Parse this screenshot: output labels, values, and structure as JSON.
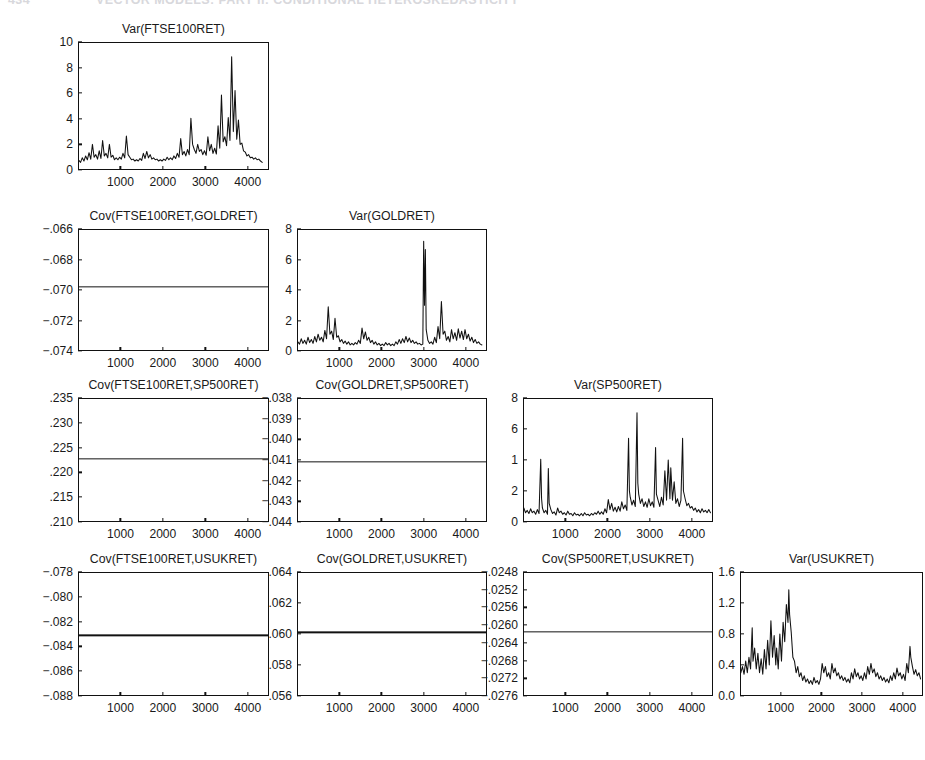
{
  "header": {
    "folio": "434",
    "running_head": "VECTOR MODELS: PART II: CONDITIONAL HETEROSKEDASTICITY"
  },
  "figure": {
    "layout": "lower-triangular matrix of variance/covariance plots",
    "rows": 4,
    "columns": 4,
    "shared_x_ticks": [
      "1000",
      "2000",
      "3000",
      "4000"
    ]
  },
  "chart_data": [
    {
      "id": "var-ftse100ret",
      "type": "line",
      "title": "Var(FTSE100RET)",
      "xlabel": "",
      "ylabel": "",
      "grid": false,
      "legend": false,
      "xlim": [
        0,
        4500
      ],
      "ylim": [
        0,
        10
      ],
      "xticks": [
        1000,
        2000,
        3000,
        4000
      ],
      "yticks": [
        0,
        2,
        4,
        6,
        8,
        10
      ],
      "ytick_labels": [
        "0",
        "2",
        "4",
        "6",
        "8",
        "10"
      ],
      "x": [
        20,
        60,
        100,
        140,
        180,
        220,
        260,
        300,
        340,
        380,
        420,
        460,
        500,
        540,
        580,
        620,
        660,
        700,
        740,
        780,
        820,
        860,
        900,
        940,
        980,
        1020,
        1060,
        1100,
        1140,
        1180,
        1220,
        1260,
        1300,
        1340,
        1380,
        1420,
        1460,
        1500,
        1540,
        1580,
        1620,
        1660,
        1700,
        1740,
        1780,
        1820,
        1860,
        1900,
        1940,
        1980,
        2020,
        2060,
        2100,
        2140,
        2180,
        2220,
        2260,
        2300,
        2340,
        2380,
        2420,
        2460,
        2500,
        2540,
        2580,
        2620,
        2660,
        2700,
        2740,
        2780,
        2820,
        2860,
        2900,
        2940,
        2980,
        3020,
        3060,
        3100,
        3140,
        3180,
        3220,
        3260,
        3300,
        3340,
        3380,
        3420,
        3460,
        3500,
        3540,
        3580,
        3620,
        3660,
        3700,
        3740,
        3780,
        3820,
        3860,
        3900,
        3940,
        3980,
        4020,
        4060,
        4100,
        4140,
        4180,
        4220,
        4260,
        4300,
        4340,
        4380,
        4420
      ],
      "values": [
        0.75,
        0.6,
        0.95,
        0.7,
        1.1,
        0.8,
        1.35,
        0.85,
        2.0,
        1.0,
        1.2,
        0.85,
        1.5,
        0.9,
        2.3,
        1.1,
        1.3,
        0.95,
        2.0,
        1.0,
        1.15,
        0.8,
        0.95,
        0.8,
        1.0,
        0.85,
        1.3,
        0.95,
        2.65,
        1.2,
        1.0,
        0.8,
        0.85,
        0.7,
        0.8,
        0.7,
        0.9,
        0.75,
        1.3,
        0.9,
        1.45,
        0.95,
        1.2,
        0.85,
        0.95,
        0.8,
        0.85,
        0.7,
        0.8,
        0.7,
        0.85,
        0.75,
        1.0,
        0.8,
        0.95,
        0.8,
        1.1,
        0.9,
        1.3,
        1.0,
        2.45,
        1.2,
        1.45,
        1.1,
        1.6,
        1.2,
        4.05,
        2.0,
        1.6,
        1.3,
        2.0,
        1.45,
        1.6,
        1.2,
        1.5,
        1.15,
        2.6,
        1.5,
        2.0,
        1.3,
        1.7,
        1.25,
        3.45,
        1.7,
        5.85,
        2.2,
        2.6,
        1.9,
        4.1,
        2.3,
        8.85,
        3.0,
        6.2,
        2.4,
        3.9,
        2.0,
        2.1,
        1.5,
        1.4,
        1.1,
        1.2,
        0.95,
        1.0,
        0.85,
        0.95,
        0.8,
        0.85,
        0.7,
        0.6
      ]
    },
    {
      "id": "cov-ftse100ret-goldret",
      "type": "line",
      "title": "Cov(FTSE100RET,GOLDRET)",
      "constant": true,
      "constant_value": -0.0698,
      "xlabel": "",
      "ylabel": "",
      "grid": false,
      "legend": false,
      "xlim": [
        0,
        4500
      ],
      "ylim": [
        -0.074,
        -0.066
      ],
      "xticks": [
        1000,
        2000,
        3000,
        4000
      ],
      "yticks": [
        -0.066,
        -0.068,
        -0.07,
        -0.072,
        -0.074
      ],
      "ytick_labels": [
        "−.066",
        "−.068",
        "−.070",
        "−.072",
        "−.074"
      ]
    },
    {
      "id": "var-goldret",
      "type": "line",
      "title": "Var(GOLDRET)",
      "xlabel": "",
      "ylabel": "",
      "grid": false,
      "legend": false,
      "xlim": [
        0,
        4500
      ],
      "ylim": [
        0,
        8
      ],
      "xticks": [
        1000,
        2000,
        3000,
        4000
      ],
      "yticks": [
        0,
        2,
        4,
        6,
        8
      ],
      "ytick_labels": [
        "0",
        "2",
        "4",
        "6",
        "8"
      ],
      "x": [
        20,
        60,
        100,
        140,
        180,
        220,
        260,
        300,
        340,
        380,
        420,
        460,
        500,
        540,
        580,
        620,
        660,
        700,
        740,
        780,
        820,
        860,
        900,
        940,
        980,
        1020,
        1060,
        1100,
        1140,
        1180,
        1220,
        1260,
        1300,
        1340,
        1380,
        1420,
        1460,
        1500,
        1540,
        1580,
        1620,
        1660,
        1700,
        1740,
        1780,
        1820,
        1860,
        1900,
        1940,
        1980,
        2020,
        2060,
        2100,
        2140,
        2180,
        2220,
        2260,
        2300,
        2340,
        2380,
        2420,
        2460,
        2500,
        2540,
        2580,
        2620,
        2660,
        2700,
        2740,
        2780,
        2820,
        2860,
        2900,
        2940,
        2980,
        3000,
        3020,
        3040,
        3060,
        3100,
        3140,
        3180,
        3220,
        3260,
        3300,
        3340,
        3380,
        3420,
        3460,
        3500,
        3540,
        3580,
        3620,
        3660,
        3700,
        3740,
        3780,
        3820,
        3860,
        3900,
        3940,
        3980,
        4020,
        4060,
        4100,
        4140,
        4180,
        4220,
        4260,
        4300,
        4340,
        4380,
        4420
      ],
      "values": [
        0.6,
        0.45,
        0.8,
        0.5,
        0.7,
        0.45,
        0.9,
        0.55,
        0.75,
        0.5,
        0.95,
        0.6,
        1.1,
        0.7,
        0.9,
        0.6,
        1.35,
        0.8,
        2.9,
        1.1,
        1.3,
        0.75,
        2.15,
        0.9,
        1.0,
        0.6,
        0.75,
        0.5,
        0.65,
        0.45,
        0.6,
        0.4,
        0.5,
        0.4,
        0.55,
        0.45,
        0.7,
        0.5,
        1.5,
        0.8,
        1.25,
        0.7,
        0.9,
        0.55,
        0.7,
        0.45,
        0.6,
        0.4,
        0.5,
        0.35,
        0.45,
        0.35,
        0.55,
        0.4,
        0.5,
        0.35,
        0.45,
        0.35,
        0.6,
        0.45,
        0.75,
        0.5,
        0.8,
        0.55,
        0.95,
        0.6,
        0.85,
        0.55,
        0.7,
        0.5,
        0.6,
        0.45,
        0.5,
        0.4,
        0.45,
        7.2,
        3.0,
        6.65,
        1.4,
        0.7,
        0.5,
        0.6,
        0.45,
        0.9,
        0.55,
        1.6,
        0.8,
        3.25,
        1.1,
        1.3,
        0.7,
        0.95,
        0.6,
        1.4,
        0.8,
        1.2,
        0.7,
        1.45,
        0.85,
        1.3,
        0.75,
        1.4,
        0.8,
        1.1,
        0.65,
        0.9,
        0.55,
        0.75,
        0.5,
        0.6,
        0.45,
        0.4
      ]
    },
    {
      "id": "cov-ftse100ret-sp500ret",
      "type": "line",
      "title": "Cov(FTSE100RET,SP500RET)",
      "constant": true,
      "constant_value": 0.2228,
      "xlabel": "",
      "ylabel": "",
      "grid": false,
      "legend": false,
      "xlim": [
        0,
        4500
      ],
      "ylim": [
        0.21,
        0.235
      ],
      "xticks": [
        1000,
        2000,
        3000,
        4000
      ],
      "yticks": [
        0.235,
        0.23,
        0.225,
        0.22,
        0.215,
        0.21
      ],
      "ytick_labels": [
        ".235",
        ".230",
        ".225",
        ".220",
        ".215",
        ".210"
      ]
    },
    {
      "id": "cov-goldret-sp500ret",
      "type": "line",
      "title": "Cov(GOLDRET,SP500RET)",
      "constant": true,
      "constant_value": -0.0411,
      "xlabel": "",
      "ylabel": "",
      "grid": false,
      "legend": false,
      "xlim": [
        0,
        4500
      ],
      "ylim": [
        -0.044,
        -0.038
      ],
      "xticks": [
        1000,
        2000,
        3000,
        4000
      ],
      "yticks": [
        -0.038,
        -0.039,
        -0.04,
        -0.041,
        -0.042,
        -0.043,
        -0.044
      ],
      "ytick_labels": [
        "−.038",
        "−.039",
        "−.040",
        "−.041",
        "−.042",
        "−.043",
        "−.044"
      ]
    },
    {
      "id": "var-sp500ret",
      "type": "line",
      "title": "Var(SP500RET)",
      "xlabel": "",
      "ylabel": "",
      "grid": false,
      "legend": false,
      "xlim": [
        0,
        4500
      ],
      "ylim": [
        0,
        8
      ],
      "xticks": [
        1000,
        2000,
        3000,
        4000
      ],
      "yticks": [
        0,
        2,
        4,
        6,
        8
      ],
      "ytick_labels": [
        "0",
        "2",
        "1",
        "6",
        "8"
      ],
      "ytick_labels_note": "third label from top renders as '1' in the scan (degraded '4')",
      "x": [
        20,
        60,
        100,
        140,
        180,
        220,
        260,
        300,
        340,
        380,
        420,
        440,
        460,
        500,
        540,
        580,
        600,
        620,
        660,
        700,
        740,
        780,
        820,
        860,
        900,
        940,
        980,
        1020,
        1060,
        1100,
        1140,
        1180,
        1220,
        1260,
        1300,
        1340,
        1380,
        1420,
        1460,
        1500,
        1540,
        1580,
        1620,
        1660,
        1700,
        1740,
        1780,
        1820,
        1860,
        1900,
        1940,
        1980,
        2020,
        2060,
        2100,
        2140,
        2180,
        2220,
        2260,
        2300,
        2340,
        2380,
        2420,
        2460,
        2500,
        2520,
        2540,
        2580,
        2620,
        2660,
        2700,
        2720,
        2740,
        2780,
        2820,
        2860,
        2900,
        2940,
        2980,
        3020,
        3060,
        3100,
        3140,
        3160,
        3200,
        3240,
        3280,
        3320,
        3360,
        3400,
        3440,
        3480,
        3500,
        3540,
        3580,
        3620,
        3660,
        3700,
        3740,
        3780,
        3800,
        3840,
        3880,
        3920,
        3960,
        4000,
        4040,
        4080,
        4120,
        4160,
        4200,
        4240,
        4280,
        4320,
        4360,
        4400,
        4440
      ],
      "values": [
        0.9,
        0.6,
        0.75,
        0.55,
        0.85,
        0.6,
        0.7,
        0.5,
        0.8,
        0.55,
        4.05,
        1.5,
        0.9,
        0.6,
        0.75,
        0.5,
        3.45,
        1.2,
        0.8,
        0.55,
        0.65,
        0.45,
        0.9,
        0.6,
        0.7,
        0.5,
        0.6,
        0.45,
        0.7,
        0.5,
        0.55,
        0.4,
        0.6,
        0.45,
        0.5,
        0.4,
        0.55,
        0.4,
        0.6,
        0.45,
        0.5,
        0.4,
        0.55,
        0.45,
        0.6,
        0.5,
        0.7,
        0.5,
        0.65,
        0.5,
        0.85,
        0.6,
        1.45,
        0.8,
        1.2,
        0.7,
        0.95,
        0.65,
        1.0,
        0.7,
        1.3,
        0.85,
        1.1,
        0.75,
        5.4,
        2.0,
        1.6,
        1.1,
        1.4,
        1.0,
        7.05,
        2.5,
        1.8,
        1.2,
        1.5,
        1.0,
        1.3,
        0.95,
        1.5,
        1.05,
        1.3,
        0.95,
        4.8,
        1.8,
        1.4,
        1.0,
        1.6,
        1.1,
        3.3,
        1.4,
        4.0,
        1.5,
        3.5,
        1.4,
        2.6,
        1.2,
        1.5,
        1.0,
        1.4,
        5.4,
        2.0,
        1.5,
        1.05,
        1.2,
        0.9,
        1.0,
        0.75,
        0.9,
        0.65,
        0.8,
        0.6,
        0.85,
        0.65,
        0.75,
        0.6,
        0.8,
        0.6,
        0.7
      ]
    },
    {
      "id": "cov-ftse100ret-usukret",
      "type": "line",
      "title": "Cov(FTSE100RET,USUKRET)",
      "constant": true,
      "constant_value": -0.0831,
      "xlabel": "",
      "ylabel": "",
      "grid": false,
      "legend": false,
      "xlim": [
        0,
        4500
      ],
      "ylim": [
        -0.088,
        -0.078
      ],
      "xticks": [
        1000,
        2000,
        3000,
        4000
      ],
      "yticks": [
        -0.078,
        -0.08,
        -0.082,
        -0.084,
        -0.086,
        -0.088
      ],
      "ytick_labels": [
        "−.078",
        "−.080",
        "−.082",
        "−.084",
        "−.086",
        "−.088"
      ]
    },
    {
      "id": "cov-goldret-usukret",
      "type": "line",
      "title": "Cov(GOLDRET,USUKRET)",
      "constant": true,
      "constant_value": 0.0601,
      "xlabel": "",
      "ylabel": "",
      "grid": false,
      "legend": false,
      "xlim": [
        0,
        4500
      ],
      "ylim": [
        0.056,
        0.064
      ],
      "xticks": [
        1000,
        2000,
        3000,
        4000
      ],
      "yticks": [
        0.064,
        0.062,
        0.06,
        0.058,
        0.056
      ],
      "ytick_labels": [
        ".064",
        ".062",
        ".060",
        ".058",
        ".056"
      ]
    },
    {
      "id": "cov-sp500ret-usukret",
      "type": "line",
      "title": "Cov(SP500RET,USUKRET)",
      "constant": true,
      "constant_value": -0.02615,
      "xlabel": "",
      "ylabel": "",
      "grid": false,
      "legend": false,
      "xlim": [
        0,
        4500
      ],
      "ylim": [
        -0.0276,
        -0.0248
      ],
      "xticks": [
        1000,
        2000,
        3000,
        4000
      ],
      "yticks": [
        -0.0248,
        -0.0252,
        -0.0256,
        -0.026,
        -0.0264,
        -0.0268,
        -0.0272,
        -0.0276
      ],
      "ytick_labels": [
        "−.0248",
        "−.0252",
        "−.0256",
        "−.0260",
        "−.0264",
        "−.0268",
        "−.0272",
        "−.0276"
      ]
    },
    {
      "id": "var-usukret",
      "type": "line",
      "title": "Var(USUKRET)",
      "xlabel": "",
      "ylabel": "",
      "grid": false,
      "legend": false,
      "xlim": [
        0,
        4500
      ],
      "ylim": [
        0.0,
        1.6
      ],
      "xticks": [
        1000,
        2000,
        3000,
        4000
      ],
      "yticks": [
        0.0,
        0.4,
        0.8,
        1.2,
        1.6
      ],
      "ytick_labels": [
        "0.0",
        "0.4",
        "0.8",
        "1.2",
        "1.6"
      ],
      "x": [
        20,
        60,
        100,
        140,
        180,
        220,
        260,
        300,
        320,
        360,
        400,
        440,
        480,
        520,
        560,
        600,
        640,
        680,
        720,
        760,
        800,
        840,
        880,
        900,
        940,
        980,
        1020,
        1060,
        1100,
        1140,
        1180,
        1200,
        1220,
        1260,
        1300,
        1340,
        1380,
        1420,
        1460,
        1500,
        1540,
        1580,
        1620,
        1660,
        1700,
        1740,
        1780,
        1820,
        1860,
        1900,
        1940,
        1980,
        2020,
        2060,
        2100,
        2140,
        2180,
        2220,
        2260,
        2300,
        2340,
        2380,
        2420,
        2460,
        2500,
        2540,
        2580,
        2620,
        2660,
        2700,
        2740,
        2780,
        2820,
        2860,
        2900,
        2940,
        2980,
        3020,
        3060,
        3100,
        3140,
        3180,
        3220,
        3260,
        3300,
        3340,
        3380,
        3420,
        3460,
        3500,
        3540,
        3580,
        3620,
        3660,
        3700,
        3740,
        3780,
        3820,
        3860,
        3900,
        3940,
        3980,
        4020,
        4060,
        4100,
        4140,
        4180,
        4200,
        4240,
        4280,
        4320,
        4360,
        4400,
        4440
      ],
      "values": [
        0.3,
        0.38,
        0.28,
        0.45,
        0.3,
        0.5,
        0.35,
        0.88,
        0.45,
        0.62,
        0.35,
        0.55,
        0.3,
        0.48,
        0.28,
        0.6,
        0.35,
        0.72,
        0.4,
        0.97,
        0.5,
        0.78,
        0.4,
        0.62,
        0.35,
        0.8,
        0.45,
        0.95,
        0.7,
        1.18,
        0.95,
        1.37,
        1.05,
        0.82,
        0.5,
        0.45,
        0.3,
        0.38,
        0.25,
        0.3,
        0.2,
        0.26,
        0.18,
        0.22,
        0.16,
        0.2,
        0.15,
        0.24,
        0.17,
        0.2,
        0.15,
        0.22,
        0.42,
        0.3,
        0.38,
        0.25,
        0.3,
        0.22,
        0.42,
        0.3,
        0.36,
        0.26,
        0.3,
        0.22,
        0.26,
        0.2,
        0.24,
        0.18,
        0.22,
        0.17,
        0.3,
        0.22,
        0.35,
        0.25,
        0.3,
        0.22,
        0.26,
        0.2,
        0.3,
        0.22,
        0.38,
        0.28,
        0.42,
        0.3,
        0.35,
        0.25,
        0.3,
        0.22,
        0.26,
        0.2,
        0.24,
        0.18,
        0.22,
        0.17,
        0.26,
        0.2,
        0.3,
        0.22,
        0.36,
        0.26,
        0.3,
        0.22,
        0.28,
        0.2,
        0.42,
        0.3,
        0.64,
        0.5,
        0.38,
        0.28,
        0.34,
        0.26,
        0.3,
        0.22,
        0.38,
        0.3
      ]
    }
  ]
}
